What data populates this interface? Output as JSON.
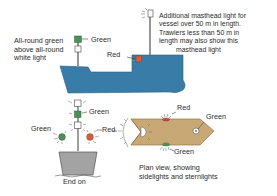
{
  "diagram": {
    "colors": {
      "hull": "#3a7ca8",
      "hull_outline": "#2a5f85",
      "deck_plan": "#c8a874",
      "deck_plan_outline": "#8f7548",
      "end_on_hull": "#a3a3a3",
      "green_light": "#4f8f5a",
      "red_light": "#d0603e",
      "white_light": "#ffffff",
      "mast": "#6a6a6a"
    },
    "side_view": {
      "all_round_label": [
        "All-round green",
        "above all-round",
        "white light"
      ],
      "green_label": "Green",
      "red_label": "Red",
      "masthead_note": [
        "Additional masthead light for",
        "vessel over 50 m in length.",
        "Trawlers less than 50 m in",
        "length may also show this",
        "masthead light"
      ]
    },
    "end_on_view": {
      "green_mast_label": "Green",
      "green_side_label": "Green",
      "red_side_label": "Red",
      "caption": "End on"
    },
    "plan_view": {
      "red_top_label": "Red",
      "green_bow_label": "Green",
      "green_bottom_label": "Green",
      "caption": [
        "Plan view, showing",
        "sidelights and sternlights"
      ]
    }
  }
}
